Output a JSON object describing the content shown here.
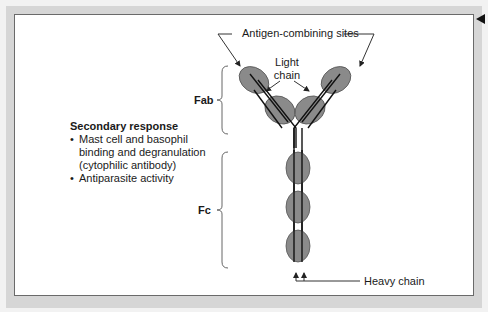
{
  "figure": {
    "labels": {
      "antigen_sites": "Antigen-combining sites",
      "light_chain_line1": "Light",
      "light_chain_line2": "chain",
      "fab": "Fab",
      "fc": "Fc",
      "heavy_chain": "Heavy chain"
    },
    "notes": {
      "heading": "Secondary response",
      "bullets": [
        "Mast cell and basophil",
        "binding and degranulation",
        "(cytophilic antibody)",
        "Antiparasite activity"
      ],
      "bullet_char": "•"
    },
    "colors": {
      "domain_fill": "#8a8a8a",
      "line": "#222222",
      "panel_border": "#6a6a6a",
      "frame": "#d6d6d6"
    },
    "nav": {
      "prev_icon": "triangle-left-icon"
    }
  }
}
